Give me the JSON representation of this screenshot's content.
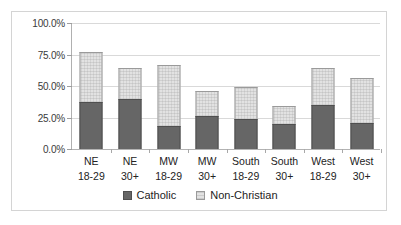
{
  "chart_data": {
    "type": "bar",
    "subtype": "stacked-bar",
    "title": "",
    "xlabel": "",
    "ylabel": "",
    "ylim": [
      0,
      100
    ],
    "yticks": [
      0,
      25,
      50,
      75,
      100
    ],
    "ytick_labels": [
      "0.0%",
      "25.0%",
      "50.0%",
      "75.0%",
      "100.0%"
    ],
    "grid": true,
    "legend_position": "bottom",
    "categories": [
      "NE 18-29",
      "NE 30+",
      "MW 18-29",
      "MW 30+",
      "South 18-29",
      "South 30+",
      "West 18-29",
      "West 30+"
    ],
    "category_lines": [
      [
        "NE",
        "18-29"
      ],
      [
        "NE",
        "30+"
      ],
      [
        "MW",
        "18-29"
      ],
      [
        "MW",
        "30+"
      ],
      [
        "South",
        "18-29"
      ],
      [
        "South",
        "30+"
      ],
      [
        "West",
        "18-29"
      ],
      [
        "West",
        "30+"
      ]
    ],
    "series": [
      {
        "name": "Catholic",
        "color": "#666666",
        "values": [
          37.0,
          40.0,
          18.0,
          26.0,
          24.0,
          20.0,
          35.0,
          21.0
        ]
      },
      {
        "name": "Non-Christian",
        "color": "#e2e2e2",
        "values": [
          40.0,
          24.0,
          49.0,
          20.0,
          25.5,
          14.0,
          29.0,
          35.0
        ]
      }
    ],
    "stack_totals": [
      77.0,
      64.0,
      67.0,
      46.0,
      49.5,
      34.0,
      64.0,
      56.0
    ]
  },
  "legend": {
    "items": [
      {
        "label": "Catholic",
        "swatch": "dark-gray-square"
      },
      {
        "label": "Non-Christian",
        "swatch": "light-gray-square"
      }
    ]
  }
}
